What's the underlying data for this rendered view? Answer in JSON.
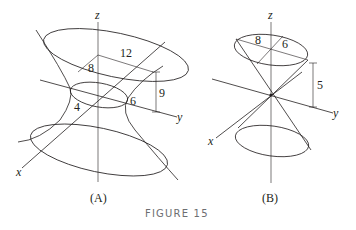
{
  "figure": {
    "caption": "FIGURE 15",
    "caption_color": "#6d6e71",
    "line_color": "#231f20"
  },
  "panel_a": {
    "label": "(A)",
    "surface": "hyperboloid of one sheet",
    "axes": {
      "x": "x",
      "y": "y",
      "z": "z"
    },
    "dimensions": {
      "top_semi_axis_x": "8",
      "top_semi_axis_y": "12",
      "height": "9",
      "waist_semi_axis_x": "4",
      "waist_semi_axis_y": "6"
    }
  },
  "panel_b": {
    "label": "(B)",
    "surface": "elliptic cone",
    "axes": {
      "x": "x",
      "y": "y",
      "z": "z"
    },
    "dimensions": {
      "top_semi_axis_y": "8",
      "top_semi_axis_x": "6",
      "height": "5"
    }
  }
}
